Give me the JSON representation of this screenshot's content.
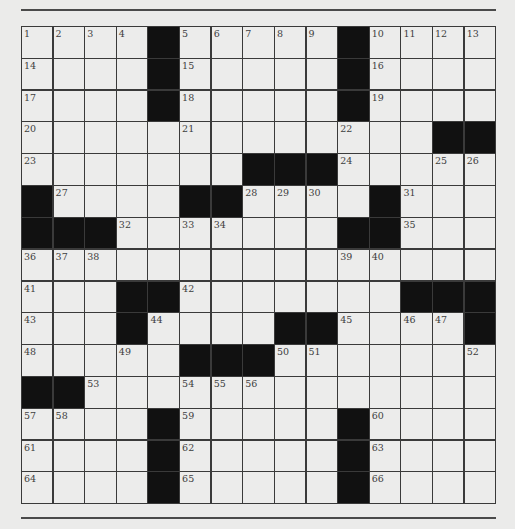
{
  "puzzle": {
    "size": {
      "rows": 15,
      "cols": 15
    },
    "grid": [
      "1234#56789#ABCD",
      "....#.....#....",
      "....#.....#....",
      "..........L..##",
      ".......###.....",
      "#.....##...#...",
      "###.......##...",
      "...............",
      "...##.......###",
      "...#....##....#",
      "....####.......",
      "##.............",
      "....#.....#....",
      "....#.....#....",
      "....#.....#...."
    ],
    "rows": [
      [
        1,
        2,
        3,
        4,
        "#",
        5,
        6,
        7,
        8,
        9,
        "#",
        10,
        11,
        12,
        13
      ],
      [
        14,
        0,
        0,
        0,
        "#",
        15,
        0,
        0,
        0,
        0,
        "#",
        16,
        0,
        0,
        0
      ],
      [
        17,
        0,
        0,
        0,
        "#",
        18,
        0,
        0,
        0,
        0,
        "#",
        19,
        0,
        0,
        0
      ],
      [
        20,
        0,
        0,
        0,
        0,
        21,
        0,
        0,
        0,
        0,
        22,
        0,
        0,
        "#",
        "#"
      ],
      [
        23,
        0,
        0,
        0,
        0,
        0,
        0,
        "#",
        "#",
        "#",
        24,
        0,
        0,
        25,
        26
      ],
      [
        "#",
        27,
        0,
        0,
        0,
        "#",
        "#",
        28,
        29,
        30,
        0,
        "#",
        31,
        0,
        0
      ],
      [
        "#",
        "#",
        "#",
        32,
        0,
        33,
        34,
        0,
        0,
        0,
        "#",
        "#",
        35,
        0,
        0
      ],
      [
        36,
        37,
        38,
        0,
        0,
        0,
        0,
        0,
        0,
        0,
        39,
        40,
        0,
        0,
        0
      ],
      [
        41,
        0,
        0,
        "#",
        "#",
        42,
        0,
        0,
        0,
        0,
        0,
        0,
        "#",
        "#",
        "#"
      ],
      [
        43,
        0,
        0,
        "#",
        44,
        0,
        0,
        0,
        "#",
        "#",
        45,
        0,
        46,
        47,
        "#"
      ],
      [
        48,
        0,
        0,
        49,
        0,
        "#",
        "#",
        "#",
        50,
        51,
        0,
        0,
        0,
        0,
        52
      ],
      [
        "#",
        "#",
        53,
        0,
        0,
        54,
        55,
        56,
        0,
        0,
        0,
        0,
        0,
        0,
        0
      ],
      [
        57,
        58,
        0,
        0,
        "#",
        59,
        0,
        0,
        0,
        0,
        "#",
        60,
        0,
        0,
        0
      ],
      [
        61,
        0,
        0,
        0,
        "#",
        62,
        0,
        0,
        0,
        0,
        "#",
        63,
        0,
        0,
        0
      ],
      [
        64,
        0,
        0,
        0,
        "#",
        65,
        0,
        0,
        0,
        0,
        "#",
        66,
        0,
        0,
        0
      ]
    ]
  },
  "colors": {
    "background": "#ebebea",
    "cell": "#ececeb",
    "block": "#111111",
    "line": "#3a3a3a"
  }
}
